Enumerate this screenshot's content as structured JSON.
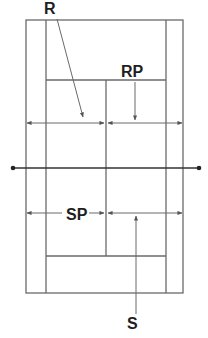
{
  "diagram": {
    "labels": {
      "receiver": "R",
      "receiver_partner": "RP",
      "server_partner": "SP",
      "server": "S"
    },
    "colors": {
      "lines": "#6a6a6a",
      "net": "#333333",
      "text": "#1e1e1e",
      "background": "#ffffff"
    }
  }
}
